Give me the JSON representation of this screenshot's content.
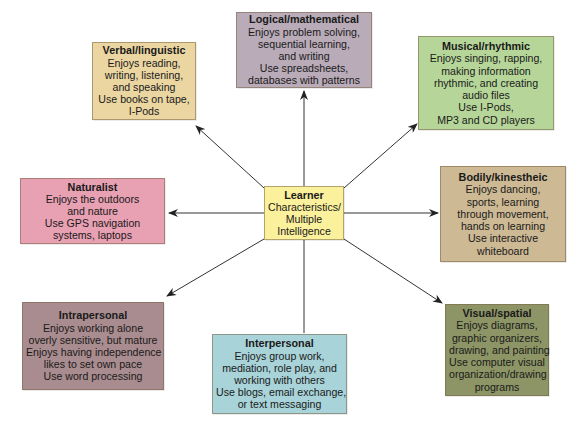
{
  "center": {
    "title": "Learner",
    "lines": [
      "Characteristics/",
      "Multiple",
      "Intelligence"
    ],
    "color": "#fbf09c"
  },
  "nodes": {
    "logical": {
      "title": "Logical/mathematical",
      "lines": [
        "Enjoys problem solving,",
        "sequential learning,",
        "and writing",
        "Use spreadsheets,",
        "databases with patterns"
      ],
      "color": "#b9abb8"
    },
    "verbal": {
      "title": "Verbal/linguistic",
      "lines": [
        "Enjoys reading,",
        "writing, listening,",
        "and speaking",
        "Use books on tape,",
        "I-Pods"
      ],
      "color": "#ebd6a2"
    },
    "musical": {
      "title": "Musical/rhythmic",
      "lines": [
        "Enjoys singing, rapping,",
        "making information",
        "rhythmic, and creating",
        "audio files",
        "Use I-Pods,",
        "MP3 and CD players"
      ],
      "color": "#b6d699"
    },
    "naturalist": {
      "title": "Naturalist",
      "lines": [
        "Enjoys the outdoors",
        "and nature",
        "Use GPS navigation",
        "systems, laptops"
      ],
      "color": "#e8a0b3"
    },
    "bodily": {
      "title": "Bodily/kinestheic",
      "lines": [
        "Enjoys dancing,",
        "sports, learning",
        "through movement,",
        "hands on learning",
        "Use interactive",
        "whiteboard"
      ],
      "color": "#cdb994"
    },
    "intrapersonal": {
      "title": "Intrapersonal",
      "lines": [
        "Enjoys working alone",
        "overly sensitive, but mature",
        "Enjoys having independence",
        "likes to set own pace",
        "Use word processing"
      ],
      "color": "#a98c8f"
    },
    "interpersonal": {
      "title": "Interpersonal",
      "lines": [
        "Enjoys group work,",
        "mediation, role play, and",
        "working with others",
        "Use blogs, email exchange,",
        "or text messaging"
      ],
      "color": "#a8d3d8"
    },
    "visual": {
      "title": "Visual/spatial",
      "lines": [
        "Enjoys diagrams,",
        "graphic organizers,",
        "drawing, and painting",
        "Use computer visual",
        "organization/drawing",
        "programs"
      ],
      "color": "#8d9566"
    }
  },
  "arrow_color": "#222222"
}
